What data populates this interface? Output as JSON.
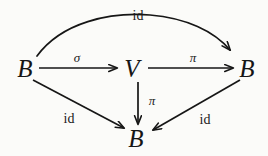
{
  "diagram": {
    "kind": "commutative-diagram",
    "nodes": [
      {
        "id": "b-left",
        "label": "B",
        "x": 25,
        "y": 68
      },
      {
        "id": "v-center",
        "label": "V",
        "x": 132,
        "y": 68
      },
      {
        "id": "b-right",
        "label": "B",
        "x": 247,
        "y": 68
      },
      {
        "id": "b-bottom",
        "label": "B",
        "x": 136,
        "y": 138
      }
    ],
    "edges": [
      {
        "id": "sigma-b-to-v",
        "label": "σ",
        "from": "b-left",
        "to": "v-center",
        "label_x": 77,
        "label_y": 57,
        "style": "greek"
      },
      {
        "id": "pi-v-to-b-right",
        "label": "π",
        "from": "v-center",
        "to": "b-right",
        "label_x": 193,
        "label_y": 57,
        "style": "greek"
      },
      {
        "id": "pi-v-to-b-bottom",
        "label": "π",
        "from": "v-center",
        "to": "b-bottom",
        "label_x": 152,
        "label_y": 100,
        "style": "greek"
      },
      {
        "id": "id-arc-top",
        "label": "id",
        "from": "b-left",
        "to": "b-right",
        "label_x": 138,
        "label_y": 16,
        "style": "roman"
      },
      {
        "id": "id-left-diagonal",
        "label": "id",
        "from": "b-left",
        "to": "b-bottom",
        "label_x": 69,
        "label_y": 119,
        "style": "roman"
      },
      {
        "id": "id-right-diagonal",
        "label": "id",
        "from": "b-right",
        "to": "b-bottom",
        "label_x": 205,
        "label_y": 120,
        "style": "roman"
      }
    ],
    "colors": {
      "ink": "#161616",
      "paper": "#fbfbf9"
    }
  }
}
